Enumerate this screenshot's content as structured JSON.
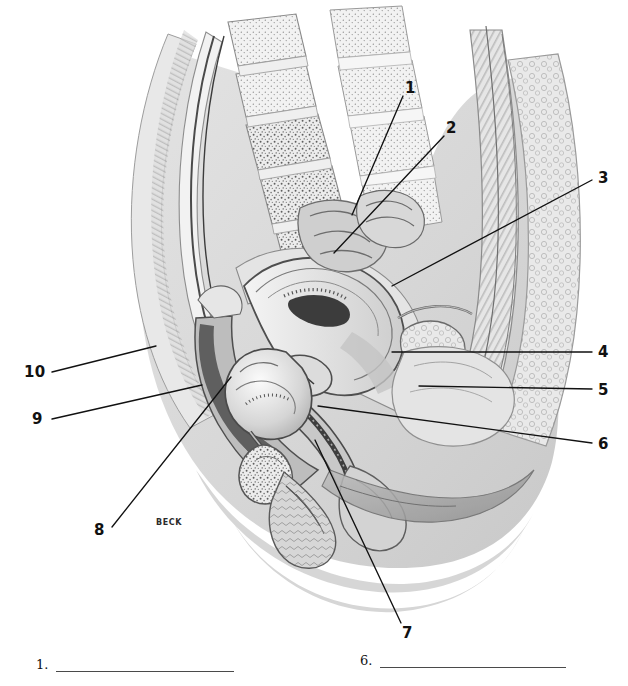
{
  "figure": {
    "signature": "BECK",
    "palette": {
      "ink": "#111111",
      "leader": "#111111",
      "body_silhouette": "#d9d9d9",
      "body_silhouette_deep": "#cfcfcf",
      "tissue_light": "#efefef",
      "tissue_mid": "#c9c9c9",
      "tissue_dark": "#8c8c8c",
      "cavity_dark": "#5a5a5a",
      "outline": "#3a3a3a",
      "background": "#ffffff"
    },
    "callouts": [
      {
        "id": "1",
        "label": "1",
        "side": "right",
        "label_x": 408,
        "label_y": 88,
        "tip_x": 352,
        "tip_y": 215
      },
      {
        "id": "2",
        "label": "2",
        "side": "right",
        "label_x": 449,
        "label_y": 128,
        "tip_x": 334,
        "tip_y": 253
      },
      {
        "id": "3",
        "label": "3",
        "side": "right",
        "label_x": 601,
        "label_y": 178,
        "tip_x": 392,
        "tip_y": 286
      },
      {
        "id": "4",
        "label": "4",
        "side": "right",
        "label_x": 601,
        "label_y": 352,
        "tip_x": 392,
        "tip_y": 352
      },
      {
        "id": "5",
        "label": "5",
        "side": "right",
        "label_x": 601,
        "label_y": 391,
        "tip_x": 419,
        "tip_y": 386
      },
      {
        "id": "6",
        "label": "6",
        "side": "right",
        "label_x": 601,
        "label_y": 446,
        "tip_x": 318,
        "tip_y": 406
      },
      {
        "id": "7",
        "label": "7",
        "side": "down",
        "label_x": 407,
        "label_y": 633,
        "tip_x": 315,
        "tip_y": 440
      },
      {
        "id": "8",
        "label": "8",
        "side": "left",
        "label_x": 101,
        "label_y": 531,
        "tip_x": 231,
        "tip_y": 377
      },
      {
        "id": "9",
        "label": "9",
        "side": "left",
        "label_x": 38,
        "label_y": 424,
        "tip_x": 202,
        "tip_y": 385
      },
      {
        "id": "10",
        "label": "10",
        "side": "left",
        "label_x": 32,
        "label_y": 377,
        "tip_x": 156,
        "tip_y": 346
      }
    ]
  },
  "answers": {
    "items": [
      {
        "index": "1.",
        "value": "",
        "rule_width": 178
      },
      {
        "index": "6.",
        "value": "",
        "rule_width": 186
      }
    ]
  }
}
